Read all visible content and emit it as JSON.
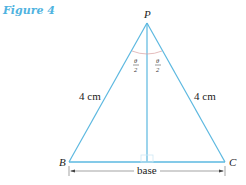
{
  "figure": {
    "title": "Figure 4",
    "vertices": {
      "top": "P",
      "left": "B",
      "right": "C"
    },
    "side_labels": {
      "left": "4 cm",
      "right": "4 cm"
    },
    "base_label": "base",
    "angle_labels": {
      "left_num": "θ",
      "left_den": "2",
      "right_num": "θ",
      "right_den": "2"
    },
    "colors": {
      "lines": "#5bb8e0",
      "title": "#4fb3e0",
      "arc": "#d9a0a0",
      "dimension": "#444444"
    }
  }
}
